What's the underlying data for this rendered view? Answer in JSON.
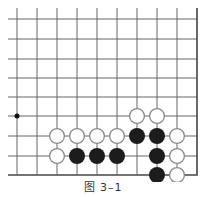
{
  "diagram": {
    "caption": "图 3–1",
    "colors": {
      "background": "#ffffff",
      "grid_line": "#666666",
      "edge_line": "#444444",
      "black_stone": "#1c1c1c",
      "white_stone_fill": "#ffffff",
      "white_stone_stroke": "#8a8a8a",
      "star_point": "#111111"
    },
    "grid": {
      "columns_x": [
        17,
        37,
        57,
        77,
        97,
        117,
        137,
        157,
        177,
        197
      ],
      "rows_y": [
        19,
        39,
        59,
        78,
        97,
        116,
        136,
        156,
        175
      ],
      "left_extent": 8,
      "top_extent": 8,
      "right_edge_is_board_edge": true,
      "bottom_edge_is_board_edge": true
    },
    "star_points": [
      {
        "col": 0,
        "row": 5
      }
    ],
    "stones": [
      {
        "color": "white",
        "col": 6,
        "row": 5
      },
      {
        "color": "white",
        "col": 7,
        "row": 5
      },
      {
        "color": "white",
        "col": 2,
        "row": 6
      },
      {
        "color": "white",
        "col": 3,
        "row": 6
      },
      {
        "color": "white",
        "col": 4,
        "row": 6
      },
      {
        "color": "white",
        "col": 5,
        "row": 6
      },
      {
        "color": "black",
        "col": 6,
        "row": 6
      },
      {
        "color": "black",
        "col": 7,
        "row": 6
      },
      {
        "color": "white",
        "col": 8,
        "row": 6
      },
      {
        "color": "white",
        "col": 2,
        "row": 7
      },
      {
        "color": "black",
        "col": 3,
        "row": 7
      },
      {
        "color": "black",
        "col": 4,
        "row": 7
      },
      {
        "color": "black",
        "col": 5,
        "row": 7
      },
      {
        "color": "black",
        "col": 7,
        "row": 7
      },
      {
        "color": "white",
        "col": 8,
        "row": 7
      },
      {
        "color": "black",
        "col": 7,
        "row": 8
      },
      {
        "color": "white",
        "col": 8,
        "row": 8
      }
    ],
    "stone_radius": 8
  }
}
